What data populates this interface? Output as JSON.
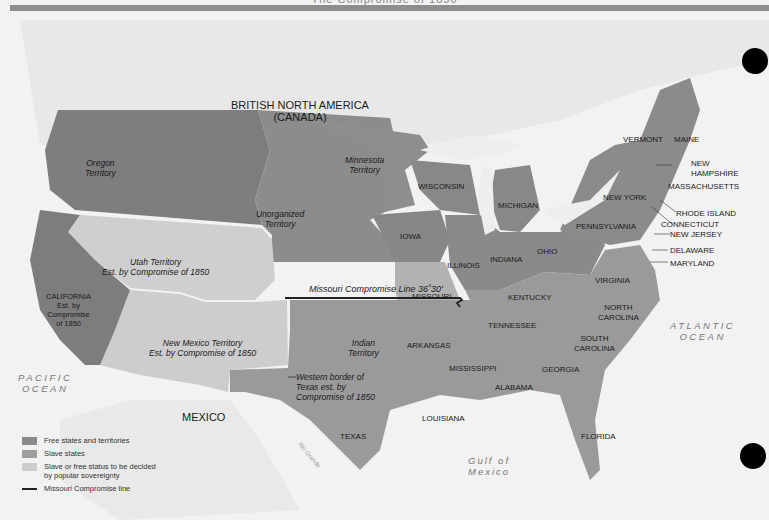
{
  "header": {
    "title": "The Compromise of 1850"
  },
  "colors": {
    "free": "#8a8a8a",
    "slave": "#9e9e9e",
    "popular": "#cdcdcd",
    "land_foreign": "#e6e6e6",
    "water": "#f4f4f4",
    "line": "#222222",
    "band": "#8d8d8d"
  },
  "regions": {
    "british_north_america": "BRITISH NORTH AMERICA",
    "canada": "(CANADA)",
    "mexico": "MEXICO"
  },
  "territories": {
    "oregon": [
      "Oregon",
      "Territory"
    ],
    "minnesota": [
      "Minnesota",
      "Territory"
    ],
    "unorganized": [
      "Unorganized",
      "Territory"
    ],
    "utah": [
      "Utah Territory",
      "Est. by Compromise of 1850"
    ],
    "new_mexico": [
      "New Mexico Territory",
      "Est. by Compromise of 1850"
    ],
    "indian": [
      "Indian",
      "Territory"
    ],
    "california": [
      "CALIFORNIA",
      "Est. by",
      "Compromise",
      "of 1850"
    ],
    "texas_border": [
      "Western border of",
      "Texas est. by",
      "Compromise of 1850"
    ]
  },
  "states": {
    "wisconsin": "WISCONSIN",
    "michigan": "MICHIGAN",
    "iowa": "IOWA",
    "illinois": "ILLINOIS",
    "indiana": "INDIANA",
    "ohio": "OHIO",
    "missouri": "MISSOURI",
    "kentucky": "KENTUCKY",
    "tennessee": "TENNESSEE",
    "arkansas": "ARKANSAS",
    "mississippi": "MISSISSIPPI",
    "alabama": "ALABAMA",
    "georgia": "GEORGIA",
    "louisiana": "LOUISIANA",
    "texas": "TEXAS",
    "florida": "FLORIDA",
    "south_carolina": [
      "SOUTH",
      "CAROLINA"
    ],
    "north_carolina": [
      "NORTH",
      "CAROLINA"
    ],
    "virginia": "VIRGINIA",
    "maryland": "MARYLAND",
    "delaware": "DELAWARE",
    "new_jersey": "NEW JERSEY",
    "connecticut": "CONNECTICUT",
    "rhode_island": "RHODE ISLAND",
    "massachusetts": "MASSACHUSETTS",
    "new_hampshire": [
      "NEW",
      "HAMPSHIRE"
    ],
    "maine": "MAINE",
    "vermont": "VERMONT",
    "new_york": "NEW YORK",
    "pennsylvania": "PENNSYLVANIA"
  },
  "water": {
    "pacific": [
      "PACIFIC",
      "OCEAN"
    ],
    "atlantic": [
      "ATLANTIC",
      "OCEAN"
    ],
    "gulf": [
      "Gulf of",
      "Mexico"
    ],
    "rio_grande": "Rio Grande"
  },
  "missouri_line": {
    "label": "Missouri Compromise Line 36˚30'"
  },
  "legend": {
    "items": [
      {
        "label": "Free states and territories",
        "type": "free"
      },
      {
        "label": "Slave states",
        "type": "slave"
      },
      {
        "label": "Slave or free status to be decided",
        "label2": "by popular sovereignty",
        "type": "popular"
      },
      {
        "label": "Missouri Compromise line",
        "type": "line"
      }
    ]
  }
}
